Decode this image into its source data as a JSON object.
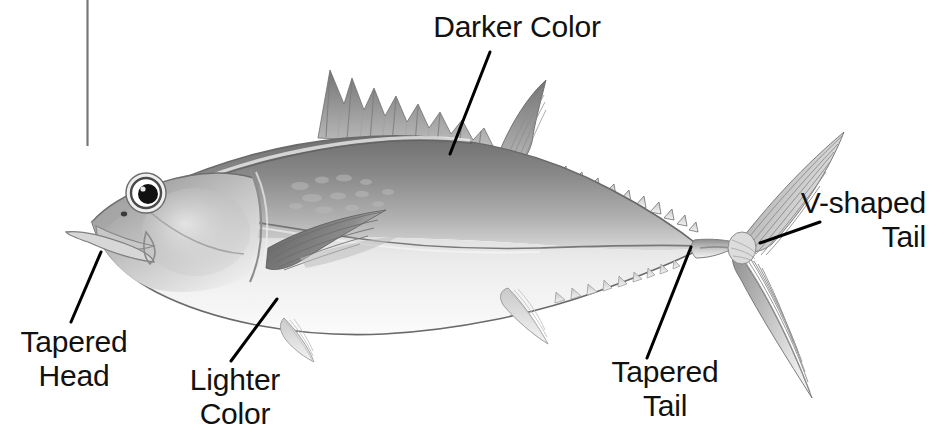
{
  "figure": {
    "kind": "labeled-diagram",
    "background_color": "#ffffff",
    "label_color": "#111111",
    "leader_line_color": "#000000"
  },
  "annotations": [
    {
      "id": "darker-color",
      "text": "Darker Color",
      "align": "center",
      "leader": {
        "from_x": 490,
        "from_y": 52,
        "to_x": 450,
        "to_y": 154
      }
    },
    {
      "id": "v-shaped-tail",
      "text": "V-shaped\nTail",
      "align": "right",
      "leader": {
        "from_x": 820,
        "from_y": 222,
        "to_x": 760,
        "to_y": 243
      }
    },
    {
      "id": "tapered-head",
      "text": "Tapered\nHead",
      "align": "center",
      "leader": {
        "from_x": 101,
        "from_y": 252,
        "to_x": 71,
        "to_y": 322
      }
    },
    {
      "id": "lighter-color",
      "text": "Lighter\nColor",
      "align": "center",
      "leader": {
        "from_x": 277,
        "from_y": 299,
        "to_x": 231,
        "to_y": 361
      }
    },
    {
      "id": "tapered-tail",
      "text": "Tapered\nTail",
      "align": "center",
      "leader": {
        "from_x": 691,
        "from_y": 247,
        "to_x": 647,
        "to_y": 358
      }
    }
  ],
  "rule": {
    "id": "vertical-rule",
    "x": 87,
    "y_top": 0,
    "y_bottom": 146,
    "color": "#777777"
  },
  "fish_parts": [
    "tapered-head",
    "eye",
    "mouth",
    "first-dorsal-fin",
    "second-dorsal-fin",
    "dorsal-finlets",
    "pectoral-fin",
    "pelvic-fin",
    "anal-fin",
    "ventral-finlets",
    "caudal-peduncle",
    "v-shaped-caudal-fin",
    "lateral-line"
  ]
}
